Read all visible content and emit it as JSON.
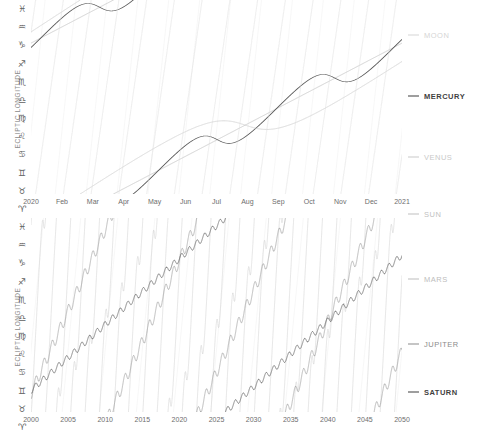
{
  "chart_data": [
    {
      "type": "line",
      "id": "inner-bodies",
      "title": "",
      "xlabel": "",
      "ylabel": "ECLIPTIC LONGITUDE",
      "grid": true,
      "legend_position": "right",
      "xticks": [
        "2020",
        "Feb",
        "Mar",
        "Apr",
        "May",
        "Jun",
        "Jul",
        "Aug",
        "Sep",
        "Oct",
        "Nov",
        "Dec",
        "2021"
      ],
      "yticks": [
        "♓",
        "♒",
        "♑",
        "♐",
        "♏",
        "♎",
        "♍",
        "♌",
        "♋",
        "♊",
        "♉",
        "♈"
      ],
      "ytick_names": [
        "Pisces",
        "Aquarius",
        "Capricorn",
        "Sagittarius",
        "Scorpio",
        "Libra",
        "Virgo",
        "Leo",
        "Cancer",
        "Gemini",
        "Taurus",
        "Aries"
      ],
      "ylim": [
        0,
        360
      ],
      "xlim_label": "2020-01-01 to 2021-01-01",
      "series": [
        {
          "name": "MOON",
          "color": "#dcdcdc",
          "width": 0.8,
          "period_days": 27.3,
          "note": "near-vertical sawtooth, ~13 cycles per year"
        },
        {
          "name": "MERCURY",
          "color": "#555555",
          "width": 1.3,
          "period_days": 88,
          "note": "rising with three retrograde loops"
        },
        {
          "name": "VENUS",
          "color": "#c8c8c8",
          "width": 1.1,
          "period_days": 225,
          "note": "rising with one broad retrograde"
        },
        {
          "name": "SUN",
          "color": "#bdbdbd",
          "width": 1.1,
          "period_days": 365,
          "note": "steady single ramp across the year"
        }
      ]
    },
    {
      "type": "line",
      "id": "outer-bodies",
      "title": "",
      "xlabel": "",
      "ylabel": "ECLIPTIC LONGITUDE",
      "grid": true,
      "legend_position": "right",
      "xticks": [
        "2000",
        "2005",
        "2010",
        "2015",
        "2020",
        "2025",
        "2030",
        "2035",
        "2040",
        "2045",
        "2050"
      ],
      "yticks": [
        "♓",
        "♒",
        "♑",
        "♐",
        "♏",
        "♎",
        "♍",
        "♌",
        "♋",
        "♊",
        "♉",
        "♈"
      ],
      "ytick_names": [
        "Pisces",
        "Aquarius",
        "Capricorn",
        "Sagittarius",
        "Scorpio",
        "Libra",
        "Virgo",
        "Leo",
        "Cancer",
        "Gemini",
        "Taurus",
        "Aries"
      ],
      "ylim": [
        0,
        360
      ],
      "xlim_label": "2000 to 2050",
      "series": [
        {
          "name": "MARS",
          "color": "#c4c4c4",
          "width": 0.85,
          "period_years": 1.88,
          "note": "steep sawtooth, ~27 cycles"
        },
        {
          "name": "JUPITER",
          "color": "#8a8a8a",
          "width": 1.1,
          "period_years": 11.86,
          "note": "medium sawtooth with yearly retrograde wiggles"
        },
        {
          "name": "SATURN",
          "color": "#4a4a4a",
          "width": 1.2,
          "period_years": 29.46,
          "note": "slow sawtooth with yearly retrograde wiggles"
        }
      ]
    }
  ],
  "top": {
    "ylabel": "ECLIPTIC LONGITUDE",
    "zodiac": [
      "♓",
      "♒",
      "♑",
      "♐",
      "♏",
      "♎",
      "♍",
      "♌",
      "♋",
      "♊",
      "♉",
      "♈"
    ],
    "xticks": [
      "2020",
      "Feb",
      "Mar",
      "Apr",
      "May",
      "Jun",
      "Jul",
      "Aug",
      "Sep",
      "Oct",
      "Nov",
      "Dec",
      "2021"
    ],
    "legend": [
      {
        "label": "MOON",
        "color": "#d5d5d5",
        "weight": "normal"
      },
      {
        "label": "MERCURY",
        "color": "#3f3f3f",
        "weight": "bold"
      },
      {
        "label": "VENUS",
        "color": "#c9c9c9",
        "weight": "normal"
      },
      {
        "label": "SUN",
        "color": "#bfbfbf",
        "weight": "normal"
      }
    ]
  },
  "bottom": {
    "ylabel": "ECLIPTIC LONGITUDE",
    "zodiac": [
      "♓",
      "♒",
      "♑",
      "♐",
      "♏",
      "♎",
      "♍",
      "♌",
      "♋",
      "♊",
      "♉",
      "♈"
    ],
    "xticks": [
      "2000",
      "2005",
      "2010",
      "2015",
      "2020",
      "2025",
      "2030",
      "2035",
      "2040",
      "2045",
      "2050"
    ],
    "legend": [
      {
        "label": "MARS",
        "color": "#bdbdbd",
        "weight": "normal"
      },
      {
        "label": "JUPITER",
        "color": "#8c8c8c",
        "weight": "normal"
      },
      {
        "label": "SATURN",
        "color": "#3f3f3f",
        "weight": "bold"
      }
    ]
  }
}
